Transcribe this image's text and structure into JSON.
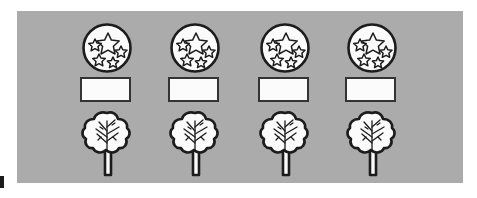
{
  "worksheet": {
    "title": "Star circles, blank boxes and trees worksheet",
    "panel_color": "#ababab",
    "ink_color": "#1c1c1c",
    "fill_color": "#fbfbfb",
    "columns": 4,
    "rows": 3,
    "edge_mark_label": "page-edge-mark"
  },
  "rows": [
    {
      "name": "star-circle-row",
      "item_label": "circle with stars",
      "stars_per_circle": 5,
      "count": 4
    },
    {
      "name": "blank-box-row",
      "item_label": "blank answer box",
      "value": "",
      "placeholder": "",
      "count": 4
    },
    {
      "name": "tree-row",
      "item_label": "tree",
      "count": 4
    }
  ],
  "items": {
    "circles": [
      {
        "id": "circle-1",
        "label": "circle with stars 1"
      },
      {
        "id": "circle-2",
        "label": "circle with stars 2"
      },
      {
        "id": "circle-3",
        "label": "circle with stars 3"
      },
      {
        "id": "circle-4",
        "label": "circle with stars 4"
      }
    ],
    "boxes": [
      {
        "id": "box-1",
        "value": ""
      },
      {
        "id": "box-2",
        "value": ""
      },
      {
        "id": "box-3",
        "value": ""
      },
      {
        "id": "box-4",
        "value": ""
      }
    ],
    "trees": [
      {
        "id": "tree-1",
        "label": "tree 1"
      },
      {
        "id": "tree-2",
        "label": "tree 2"
      },
      {
        "id": "tree-3",
        "label": "tree 3"
      },
      {
        "id": "tree-4",
        "label": "tree 4"
      }
    ]
  }
}
